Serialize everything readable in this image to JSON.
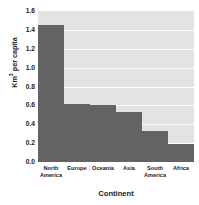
{
  "chart_data": {
    "type": "bar",
    "title": "",
    "subtitle": "",
    "categories": [
      "North America",
      "Europe",
      "Oceania",
      "Asia",
      "South America",
      "Africa"
    ],
    "values": [
      1.45,
      0.62,
      0.6,
      0.53,
      0.33,
      0.19
    ],
    "xlabel": "Continent",
    "ylabel_text": "Km",
    "ylabel_sup": "3",
    "ylabel_rest": " per capita",
    "ylabel_full": "Km3 per capita",
    "ylim": [
      0.0,
      1.6
    ],
    "yticks": [
      "1.6",
      "1.4",
      "1.2",
      "1.0",
      "0.8",
      "0.6",
      "0.4",
      "0.2",
      "0.0"
    ],
    "ytick_values": [
      1.6,
      1.4,
      1.2,
      1.0,
      0.8,
      0.6,
      0.4,
      0.2,
      0.0
    ],
    "grid": true,
    "grid_color": "#ffffff",
    "legend": null,
    "bar_color": "#636363",
    "plot_background": "#e3e3e3",
    "page_background": "#ffffff"
  }
}
